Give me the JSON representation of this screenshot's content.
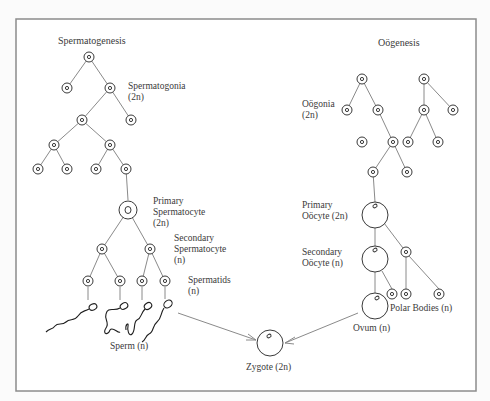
{
  "diagram": {
    "left": {
      "title": "Spermatogenesis",
      "spermatogonia_label": "Spermatogonia",
      "spermatogonia_ploidy": "(2n)",
      "primary_label_1": "Primary",
      "primary_label_2": "Spermatocyte",
      "primary_ploidy": "(2n)",
      "secondary_label_1": "Secondary",
      "secondary_label_2": "Spermatocyte",
      "secondary_ploidy": "(n)",
      "spermatids_label": "Spermatids",
      "spermatids_ploidy": "(n)",
      "sperm_label": "Sperm (n)"
    },
    "right": {
      "title": "Oögenesis",
      "oogonia_label": "Oögonia",
      "oogonia_ploidy": "(2n)",
      "primary_label_1": "Primary",
      "primary_label_2": "Oöcyte (2n)",
      "secondary_label_1": "Secondary",
      "secondary_label_2": "Oöcyte (n)",
      "polar_label": "Polar Bodies (n)",
      "ovum_label": "Ovum (n)"
    },
    "center": {
      "zygote_label": "Zygote (2n)"
    },
    "colors": {
      "line": "#8a8a8a",
      "cell": "#3a3a3a",
      "frame": "#8c8c8c",
      "background": "#ffffff"
    }
  }
}
